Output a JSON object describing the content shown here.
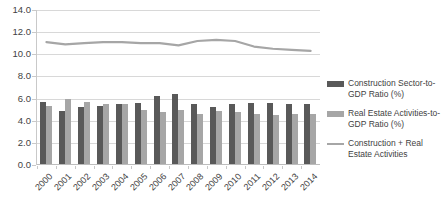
{
  "chart_data": {
    "type": "bar",
    "title": "",
    "subtitle": "",
    "xlabel": "",
    "ylabel": "",
    "ylim": [
      0.0,
      14.0
    ],
    "ytick_step": 2.0,
    "ytick_labels": [
      "0.0",
      "2.0",
      "4.0",
      "6.0",
      "8.0",
      "10.0",
      "12.0",
      "14.0"
    ],
    "ytick_values": [
      0.0,
      2.0,
      4.0,
      6.0,
      8.0,
      10.0,
      12.0,
      14.0
    ],
    "grid": true,
    "grid_axis": "y",
    "legend_position": "right",
    "categories": [
      "2000",
      "2001",
      "2002",
      "2003",
      "2004",
      "2005",
      "2006",
      "2007",
      "2008",
      "2009",
      "2010",
      "2011",
      "2012",
      "2013",
      "2014"
    ],
    "series": [
      {
        "name": "Construction Sector-to-GDP Ratio (%)",
        "type": "bar",
        "color": "#595959",
        "values": [
          5.7,
          4.9,
          5.2,
          5.3,
          5.5,
          5.6,
          6.2,
          6.4,
          5.5,
          5.2,
          5.5,
          5.6,
          5.6,
          5.5,
          5.5
        ]
      },
      {
        "name": "Real Estate Activities-to-GDP Ratio (%)",
        "type": "bar",
        "color": "#a6a6a6",
        "values": [
          5.3,
          6.0,
          5.7,
          5.5,
          5.5,
          5.0,
          4.8,
          5.0,
          4.6,
          4.9,
          4.8,
          4.6,
          4.5,
          4.6,
          4.6
        ]
      },
      {
        "name": "Construction + Real Estate Activities",
        "type": "line",
        "color": "#a6a6a6",
        "values": [
          11.1,
          10.9,
          11.0,
          11.1,
          11.1,
          11.0,
          11.0,
          10.8,
          11.2,
          11.3,
          11.2,
          10.7,
          10.5,
          10.4,
          10.3
        ]
      }
    ],
    "legend": [
      {
        "label": "Construction Sector-to-GDP Ratio (%)",
        "marker": "bar-swatch",
        "color": "#595959"
      },
      {
        "label": "Real Estate Activities-to-GDP Ratio (%)",
        "marker": "bar-swatch",
        "color": "#a6a6a6"
      },
      {
        "label": "Construction + Real Estate Activities",
        "marker": "line-swatch",
        "color": "#a6a6a6"
      }
    ]
  }
}
